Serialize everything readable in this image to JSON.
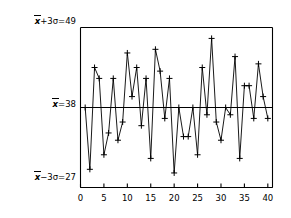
{
  "chart_data": {
    "type": "line",
    "title": "",
    "xlabel": "",
    "ylabel": "",
    "xlim": [
      0,
      41
    ],
    "ylim": [
      27,
      49
    ],
    "grid": false,
    "legend_position": "none",
    "marker": "plus",
    "x_tick_labels": [
      "0",
      "5",
      "10",
      "15",
      "20",
      "25",
      "30",
      "35",
      "40"
    ],
    "x_ticks": [
      0,
      5,
      10,
      15,
      20,
      25,
      30,
      35,
      40
    ],
    "reference_lines": [
      {
        "name": "upper-control-limit",
        "label": "x̄+3σ=49",
        "value": 49
      },
      {
        "name": "center-line",
        "label": "x̄=38",
        "value": 38
      },
      {
        "name": "lower-control-limit",
        "label": "x̄−3σ=27",
        "value": 27
      }
    ],
    "series": [
      {
        "name": "measurement",
        "x": [
          1,
          2,
          3,
          4,
          5,
          6,
          7,
          8,
          9,
          10,
          11,
          12,
          13,
          14,
          15,
          16,
          17,
          18,
          19,
          20,
          21,
          22,
          23,
          24,
          25,
          26,
          27,
          28,
          29,
          30,
          31,
          32,
          33,
          34,
          35,
          36,
          37,
          38,
          39,
          40
        ],
        "values": [
          38.0,
          29.5,
          43.5,
          42.0,
          31.5,
          34.5,
          42.0,
          33.5,
          36.0,
          45.5,
          39.5,
          43.5,
          35.5,
          42.0,
          31.0,
          46.0,
          43.0,
          36.5,
          42.0,
          29.0,
          38.0,
          34.0,
          34.0,
          38.0,
          31.5,
          43.5,
          37.0,
          47.5,
          36.0,
          33.5,
          38.0,
          37.0,
          45.0,
          31.0,
          41.0,
          41.0,
          36.5,
          44.0,
          39.5,
          36.5
        ]
      }
    ]
  },
  "labels": {
    "ucl_prefix_var": "x",
    "ucl_text": "+3σ=49",
    "cl_prefix_var": "x",
    "cl_text": "=38",
    "lcl_prefix_var": "x",
    "lcl_text": "−3σ=27"
  },
  "colors": {
    "line": "#000000",
    "axis": "#000000",
    "background": "#ffffff",
    "reference": "#000000"
  }
}
